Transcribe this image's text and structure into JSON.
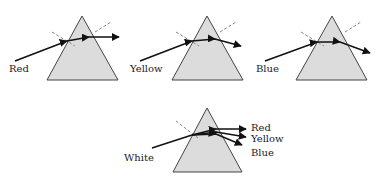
{
  "figure": {
    "colors": {
      "prism_fill": "#dcdcdc",
      "prism_stroke": "#444444",
      "ray": "#111111",
      "normal": "#888888"
    },
    "panels": [
      {
        "id": "red",
        "label": "Red",
        "prism": {
          "apex": [
            82,
            16
          ],
          "left": [
            47,
            80
          ],
          "right": [
            118,
            80
          ]
        },
        "label_pos": [
          9,
          72
        ],
        "ray": [
          [
            15,
            61
          ],
          [
            67,
            41
          ],
          [
            89,
            37
          ],
          [
            119,
            37
          ]
        ],
        "normals": [
          [
            [
              52,
              32
            ],
            [
              75,
              46
            ]
          ],
          [
            [
              95,
              32
            ],
            [
              111,
              22
            ]
          ]
        ]
      },
      {
        "id": "yellow",
        "label": "Yellow",
        "prism": {
          "apex": [
            207,
            16
          ],
          "left": [
            172,
            80
          ],
          "right": [
            243,
            80
          ]
        },
        "label_pos": [
          130,
          72
        ],
        "ray": [
          [
            140,
            61
          ],
          [
            192,
            41
          ],
          [
            215,
            39
          ],
          [
            241,
            46
          ]
        ],
        "normals": [
          [
            [
              176,
              32
            ],
            [
              199,
              46
            ]
          ],
          [
            [
              220,
              32
            ],
            [
              236,
              22
            ]
          ]
        ]
      },
      {
        "id": "blue",
        "label": "Blue",
        "prism": {
          "apex": [
            332,
            16
          ],
          "left": [
            296,
            80
          ],
          "right": [
            367,
            80
          ]
        },
        "label_pos": [
          256,
          72
        ],
        "ray": [
          [
            265,
            61
          ],
          [
            317,
            42
          ],
          [
            340,
            42
          ],
          [
            370,
            53
          ]
        ],
        "normals": [
          [
            [
              301,
              32
            ],
            [
              324,
              46
            ]
          ],
          [
            [
              345,
              32
            ],
            [
              361,
              22
            ]
          ]
        ]
      },
      {
        "id": "white",
        "label": "White",
        "prism": {
          "apex": [
            207,
            108
          ],
          "left": [
            173,
            172
          ],
          "right": [
            242,
            172
          ]
        },
        "label_pos": [
          124,
          161
        ],
        "ray": [
          [
            152,
            148
          ],
          [
            192,
            135
          ]
        ],
        "normals": [
          [
            [
              176,
              121
            ],
            [
              198,
              138
            ]
          ]
        ],
        "outputs": [
          {
            "label": "Red",
            "path": [
              [
                192,
                135
              ],
              [
                216,
                129
              ],
              [
                246,
                129
              ]
            ],
            "label_pos": [
              251,
              131
            ]
          },
          {
            "label": "Yellow",
            "path": [
              [
                192,
                135
              ],
              [
                216,
                132
              ],
              [
                246,
                137
              ]
            ],
            "label_pos": [
              251,
              142
            ]
          },
          {
            "label": "Blue",
            "path": [
              [
                192,
                135
              ],
              [
                216,
                134
              ],
              [
                242,
                145
              ]
            ],
            "label_pos": [
              251,
              156
            ]
          }
        ]
      }
    ]
  }
}
